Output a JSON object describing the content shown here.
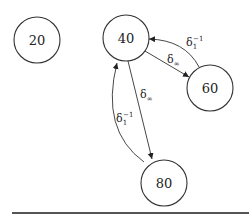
{
  "diagram": {
    "nodes": [
      {
        "id": "n20",
        "label": "20",
        "cx": 37,
        "cy": 40
      },
      {
        "id": "n40",
        "label": "40",
        "cx": 126,
        "cy": 38
      },
      {
        "id": "n60",
        "label": "60",
        "cx": 210,
        "cy": 88
      },
      {
        "id": "n80",
        "label": "80",
        "cx": 164,
        "cy": 183
      }
    ],
    "edges": [
      {
        "from": "40",
        "to": "60",
        "label_base": "δ",
        "label_sub": "∞",
        "label_sup": ""
      },
      {
        "from": "60",
        "to": "40",
        "label_base": "δ",
        "label_sub": "1",
        "label_sup": "−1"
      },
      {
        "from": "40",
        "to": "80",
        "label_base": "δ",
        "label_sub": "∞",
        "label_sup": ""
      },
      {
        "from": "80",
        "to": "40",
        "label_base": "δ",
        "label_sub": "1",
        "label_sup": "−1"
      }
    ],
    "node_radius": 23
  }
}
